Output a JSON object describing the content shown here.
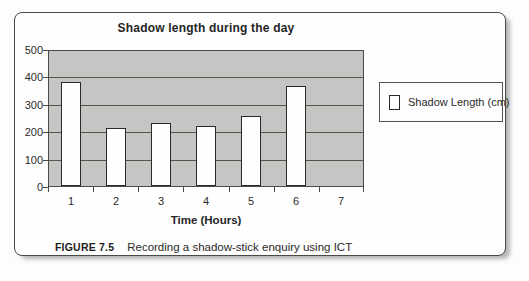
{
  "figure": {
    "caption_label": "FIGURE 7.5",
    "caption_text": "Recording a shadow-stick enquiry using ICT"
  },
  "chart_data": {
    "type": "bar",
    "title": "Shadow length during the day",
    "xlabel": "Time (Hours)",
    "ylabel": "",
    "categories": [
      "1",
      "2",
      "3",
      "4",
      "5",
      "6",
      "7"
    ],
    "series": [
      {
        "name": "Shadow Length (cm)",
        "values": [
          380,
          210,
          230,
          220,
          255,
          365,
          0
        ]
      }
    ],
    "ylim": [
      0,
      500
    ],
    "yticks": [
      0,
      100,
      200,
      300,
      400,
      500
    ],
    "grid": "horizontal",
    "legend_position": "right",
    "colors": {
      "bar_fill": "#fefefe",
      "bar_border": "#2a2a28",
      "plot_bg": "#c5c5c3",
      "gridline": "#55554f",
      "text": "#2c2c2c"
    }
  }
}
